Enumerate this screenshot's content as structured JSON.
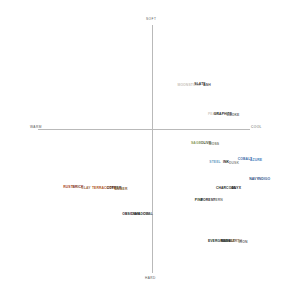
{
  "chart_data": {
    "type": "scatter",
    "title": "",
    "subtitle": "",
    "xlabel": "",
    "ylabel": "",
    "grid": false,
    "legend_position": "none",
    "axis_labels": {
      "top": "SOFT",
      "bottom": "HARD",
      "left": "WARM",
      "right": "COOL"
    },
    "axis_ranges": {
      "x": [
        -1,
        1
      ],
      "y": [
        -1,
        1
      ]
    },
    "axis_origin_px": {
      "x": 152,
      "y": 129
    },
    "colors": {
      "axis": "#b9b9b9",
      "axis_label": "#555555",
      "background": "#ffffff"
    },
    "points": [
      {
        "label": "MOONSTONE",
        "x_px": 189,
        "y_px": 86,
        "color": "#c9c3bb"
      },
      {
        "label": "SLATE",
        "x_px": 200,
        "y_px": 85,
        "color": "#3a3a3a"
      },
      {
        "label": "ASH",
        "x_px": 207,
        "y_px": 86,
        "color": "#4a4a4a"
      },
      {
        "label": "PEARL",
        "x_px": 214,
        "y_px": 115,
        "color": "#cfcbc4"
      },
      {
        "label": "GRAPHITE",
        "x_px": 223,
        "y_px": 115,
        "color": "#2e2e2e"
      },
      {
        "label": "SMOKE",
        "x_px": 233,
        "y_px": 116,
        "color": "#6e6e6e"
      },
      {
        "label": "SAGE",
        "x_px": 196,
        "y_px": 144,
        "color": "#8a9a5b"
      },
      {
        "label": "OLIVE",
        "x_px": 206,
        "y_px": 144,
        "color": "#3c3f2a"
      },
      {
        "label": "MOSS",
        "x_px": 214,
        "y_px": 145,
        "color": "#7d7d6a"
      },
      {
        "label": "STEEL",
        "x_px": 215,
        "y_px": 163,
        "color": "#6e9ec4"
      },
      {
        "label": "INK",
        "x_px": 226,
        "y_px": 163,
        "color": "#262626"
      },
      {
        "label": "DUSK",
        "x_px": 234,
        "y_px": 164,
        "color": "#8e8e8e"
      },
      {
        "label": "COBALT",
        "x_px": 245,
        "y_px": 160,
        "color": "#3b6ea8"
      },
      {
        "label": "AZURE",
        "x_px": 256,
        "y_px": 161,
        "color": "#4b7fbe"
      },
      {
        "label": "NAVY",
        "x_px": 254,
        "y_px": 180,
        "color": "#2c4a7c"
      },
      {
        "label": "INDIGO",
        "x_px": 264,
        "y_px": 180,
        "color": "#3a5c93"
      },
      {
        "label": "CHARCOAL",
        "x_px": 226,
        "y_px": 189,
        "color": "#2a2a2a"
      },
      {
        "label": "ONYX",
        "x_px": 236,
        "y_px": 189,
        "color": "#1c1c1c"
      },
      {
        "label": "RUST",
        "x_px": 68,
        "y_px": 188,
        "color": "#a8441f"
      },
      {
        "label": "BRICK",
        "x_px": 78,
        "y_px": 188,
        "color": "#7b2d16"
      },
      {
        "label": "CLAY",
        "x_px": 86,
        "y_px": 189,
        "color": "#9c6b4a"
      },
      {
        "label": "TERRACOTTA",
        "x_px": 104,
        "y_px": 189,
        "color": "#b05a28"
      },
      {
        "label": "COPPER",
        "x_px": 114,
        "y_px": 189,
        "color": "#3c2a1e"
      },
      {
        "label": "AMBER",
        "x_px": 121,
        "y_px": 190,
        "color": "#8a6a44"
      },
      {
        "label": "PINE",
        "x_px": 199,
        "y_px": 201,
        "color": "#1f3a2a"
      },
      {
        "label": "FOREST",
        "x_px": 208,
        "y_px": 201,
        "color": "#2c2c2c"
      },
      {
        "label": "FERN",
        "x_px": 218,
        "y_px": 201,
        "color": "#777777"
      },
      {
        "label": "OBSIDIAN",
        "x_px": 131,
        "y_px": 215,
        "color": "#1a1a1a"
      },
      {
        "label": "SHADOW",
        "x_px": 141,
        "y_px": 215,
        "color": "#3d3d3d"
      },
      {
        "label": "COAL",
        "x_px": 148,
        "y_px": 215,
        "color": "#555555"
      },
      {
        "label": "EVERGREEN",
        "x_px": 219,
        "y_px": 242,
        "color": "#15301f"
      },
      {
        "label": "BASALT",
        "x_px": 228,
        "y_px": 242,
        "color": "#2b2b2b"
      },
      {
        "label": "EARTH",
        "x_px": 236,
        "y_px": 242,
        "color": "#8a6a4a"
      },
      {
        "label": "IRON",
        "x_px": 243,
        "y_px": 243,
        "color": "#6a6a6a"
      }
    ]
  }
}
